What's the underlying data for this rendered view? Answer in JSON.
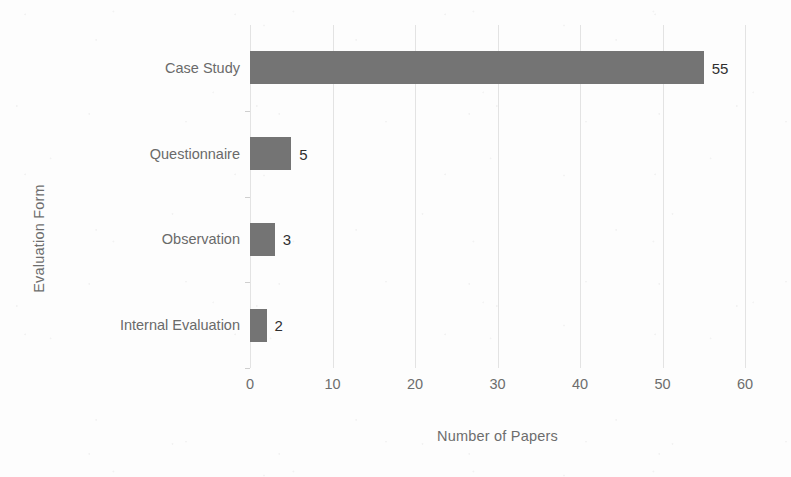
{
  "chart_data": {
    "type": "bar",
    "orientation": "horizontal",
    "title": "",
    "xlabel": "Number of Papers",
    "ylabel": "Evaluation Form",
    "categories": [
      "Case Study",
      "Questionnaire",
      "Observation",
      "Internal Evaluation"
    ],
    "values": [
      55,
      5,
      3,
      2
    ],
    "value_labels": [
      "55",
      "5",
      "3",
      "2"
    ],
    "xlim": [
      0,
      60
    ],
    "xticks": [
      0,
      10,
      20,
      30,
      40,
      50,
      60
    ],
    "xtick_labels": [
      "0",
      "10",
      "20",
      "30",
      "40",
      "50",
      "60"
    ],
    "grid": "vertical",
    "legend": "none",
    "series": [
      {
        "name": "Number of Papers",
        "values": [
          55,
          5,
          3,
          2
        ]
      }
    ],
    "colors": {
      "bar": "#747474",
      "gridline": "#e3e3e3",
      "axis": "#c9c9c9",
      "tick_text": "#6d6d6d",
      "value_text": "#2f2f2f",
      "background": "#fdfdfd"
    }
  }
}
